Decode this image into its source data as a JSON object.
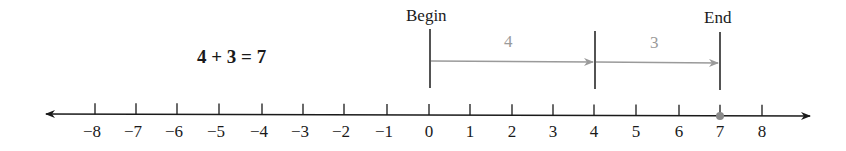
{
  "equation": "4 + 3 = 7",
  "markers": {
    "begin": {
      "label": "Begin",
      "value": 0
    },
    "end": {
      "label": "End",
      "value": 7
    }
  },
  "steps": [
    {
      "label": "4",
      "from": 0,
      "to": 4
    },
    {
      "label": "3",
      "from": 4,
      "to": 7
    }
  ],
  "number_line": {
    "min": -8,
    "max": 8,
    "ticks": [
      "−8",
      "−7",
      "−6",
      "−5",
      "−4",
      "−3",
      "−2",
      "−1",
      "0",
      "1",
      "2",
      "3",
      "4",
      "5",
      "6",
      "7",
      "8"
    ],
    "highlight_point": 7,
    "highlight_color": "#8a8a8a",
    "axis_color": "#1a1a1a",
    "step_arrow_color": "#9a9a9a"
  }
}
